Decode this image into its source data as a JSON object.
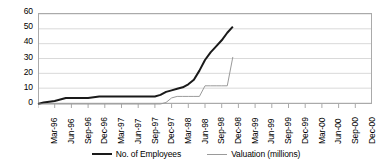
{
  "chart_data": {
    "type": "line",
    "title": "",
    "xlabel": "",
    "ylabel": "",
    "ylim": [
      0,
      60
    ],
    "ytick_values": [
      60,
      50,
      40,
      30,
      20,
      10,
      0
    ],
    "ytick_labels": [
      "60",
      "50",
      "40",
      "30",
      "20",
      "10",
      "0"
    ],
    "grid": true,
    "grid_axis": "y",
    "legend_position": "bottom",
    "categories": [
      "Mar-96",
      "Jun-96",
      "Sep-96",
      "Dec-96",
      "Mar-97",
      "Jun-97",
      "Sep-97",
      "Dec-97",
      "Mar-98",
      "Jun-98",
      "Sep-98",
      "Dec-98",
      "Mar-99",
      "Jun-99",
      "Sep-99",
      "Dec-99",
      "Mar-00",
      "Jun-00",
      "Sep-00",
      "Dec-00"
    ],
    "series": [
      {
        "name": "No. of Employees",
        "color": "#1a1a1a",
        "width": 2,
        "x": [
          "Mar-96",
          "Apr-96",
          "Jun-96",
          "Aug-96",
          "Sep-96",
          "Nov-96",
          "Dec-96",
          "Feb-97",
          "Mar-97",
          "May-97",
          "Jun-97",
          "Aug-97",
          "Sep-97",
          "Nov-97",
          "Dec-97",
          "Jan-98",
          "Feb-98",
          "Mar-98",
          "Apr-98",
          "May-98",
          "Jun-98",
          "Jul-98",
          "Aug-98",
          "Sep-98",
          "Oct-98",
          "Nov-98",
          "Dec-98",
          "Jan-99",
          "Feb-99"
        ],
        "values": [
          0,
          1,
          2,
          4,
          4,
          4,
          4,
          5,
          5,
          5,
          5,
          5,
          5,
          5,
          5,
          6,
          8,
          9,
          10,
          11,
          13,
          16,
          22,
          29,
          34,
          38,
          42,
          47,
          51
        ]
      },
      {
        "name": "Valuation (millions)",
        "color": "#9a9a9a",
        "width": 1,
        "x": [
          "Mar-96",
          "Jun-96",
          "Sep-96",
          "Dec-96",
          "Mar-97",
          "Jun-97",
          "Sep-97",
          "Dec-97",
          "Jan-98",
          "Feb-98",
          "Mar-98",
          "Apr-98",
          "May-98",
          "Jun-98",
          "Jul-98",
          "Aug-98",
          "Sep-98",
          "Oct-98",
          "Nov-98",
          "Dec-98",
          "Jan-99",
          "Feb-99"
        ],
        "values": [
          0,
          0,
          0,
          0,
          0,
          0,
          0,
          0,
          0,
          1,
          4,
          5,
          5,
          5,
          5,
          5,
          12,
          12,
          12,
          12,
          12,
          31
        ]
      }
    ],
    "legend": [
      {
        "label": "No. of Employees",
        "swatch": "thick",
        "color": "#1a1a1a"
      },
      {
        "label": "Valuation (millions)",
        "swatch": "thin",
        "color": "#9a9a9a"
      }
    ]
  }
}
